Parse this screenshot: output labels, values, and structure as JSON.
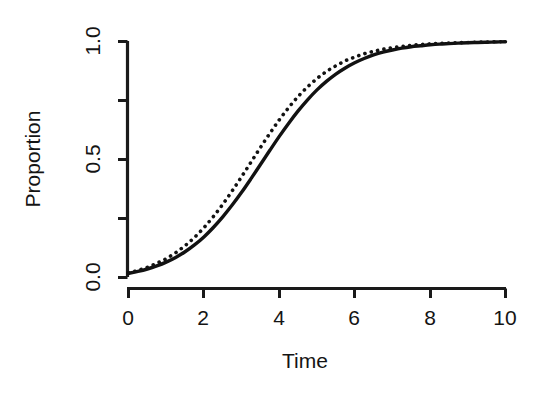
{
  "figure": {
    "background_color": "#ffffff",
    "foreground_color": "#121212",
    "width": 535,
    "height": 395
  },
  "axes": {
    "x_title": "Time",
    "y_title": "Proportion",
    "x_tick_labels": [
      "0",
      "2",
      "4",
      "6",
      "8",
      "10"
    ],
    "y_tick_labels": [
      "0.0",
      "0.5",
      "1.0"
    ]
  },
  "chart_data": {
    "type": "line",
    "title": "",
    "subtitle": "",
    "xlabel": "Time",
    "ylabel": "Proportion",
    "xlim": [
      0,
      10
    ],
    "ylim": [
      0,
      1
    ],
    "x_ticks": [
      0,
      2,
      4,
      6,
      8,
      10
    ],
    "x_tick_labels": [
      "0",
      "2",
      "4",
      "6",
      "8",
      "10"
    ],
    "y_ticks": [
      0.0,
      0.25,
      0.5,
      0.75,
      1.0
    ],
    "y_tick_labels": [
      "0.0",
      "",
      "0.5",
      "",
      "1.0"
    ],
    "y_minor_ticks": [
      0.25,
      0.75
    ],
    "grid": false,
    "legend": null,
    "legend_position": "none",
    "annotations": [],
    "x": [
      0.0,
      0.25,
      0.5,
      0.75,
      1.0,
      1.25,
      1.5,
      1.75,
      2.0,
      2.25,
      2.5,
      2.75,
      3.0,
      3.25,
      3.5,
      3.75,
      4.0,
      4.25,
      4.5,
      4.75,
      5.0,
      5.25,
      5.5,
      5.75,
      6.0,
      6.25,
      6.5,
      6.75,
      7.0,
      7.25,
      7.5,
      7.75,
      8.0,
      8.25,
      8.5,
      8.75,
      9.0,
      9.25,
      9.5,
      9.75,
      10.0
    ],
    "series": [
      {
        "name": "solid-curve",
        "style": "solid",
        "color": "#121212",
        "values": [
          0.018,
          0.026,
          0.036,
          0.049,
          0.065,
          0.085,
          0.109,
          0.138,
          0.172,
          0.212,
          0.257,
          0.307,
          0.361,
          0.419,
          0.479,
          0.539,
          0.598,
          0.654,
          0.706,
          0.753,
          0.795,
          0.831,
          0.862,
          0.888,
          0.91,
          0.928,
          0.943,
          0.955,
          0.964,
          0.972,
          0.978,
          0.982,
          0.986,
          0.989,
          0.991,
          0.993,
          0.995,
          0.996,
          0.997,
          0.998,
          0.999
        ]
      },
      {
        "name": "dotted-curve",
        "style": "dotted",
        "color": "#121212",
        "values": [
          0.02,
          0.03,
          0.043,
          0.06,
          0.08,
          0.105,
          0.135,
          0.17,
          0.211,
          0.258,
          0.31,
          0.367,
          0.427,
          0.489,
          0.551,
          0.611,
          0.668,
          0.72,
          0.767,
          0.808,
          0.843,
          0.873,
          0.897,
          0.918,
          0.934,
          0.948,
          0.958,
          0.967,
          0.974,
          0.979,
          0.984,
          0.987,
          0.99,
          0.992,
          0.994,
          0.995,
          0.996,
          0.997,
          0.998,
          0.999,
          0.999
        ]
      }
    ]
  }
}
